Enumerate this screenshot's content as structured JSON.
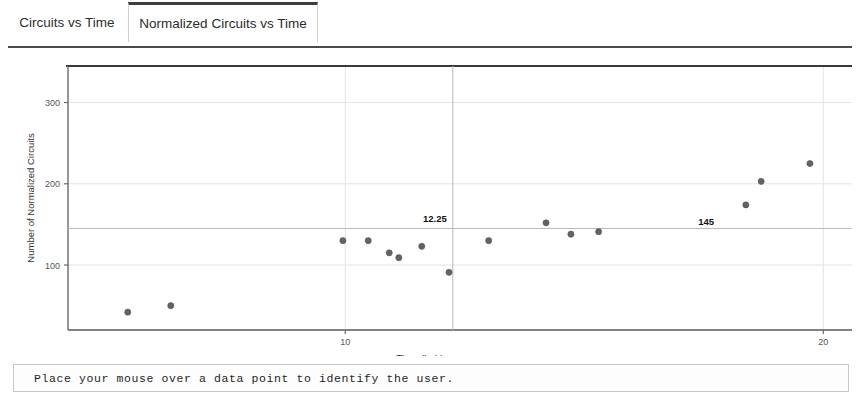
{
  "tabs": [
    {
      "label": "Circuits vs Time",
      "active": false
    },
    {
      "label": "Normalized Circuits vs Time",
      "active": true
    }
  ],
  "status": {
    "message": "Place your mouse over a data point to identify the user."
  },
  "colors": {
    "point": "#636363",
    "axis": "#4a4a4a",
    "grid": "#e3e3e3",
    "marker_line": "#b8b8b8",
    "text": "#1a1a1a",
    "panel_border": "#9a9a9a",
    "tab_active_top": "#3d3d3d"
  },
  "chart_data": {
    "type": "scatter",
    "title": "",
    "xlabel": "Time (in h)",
    "ylabel": "Number of Normalized Circuits",
    "xlim": [
      4.2,
      20.6
    ],
    "ylim": [
      20,
      345
    ],
    "xticks": [
      10,
      20
    ],
    "xticklabels": [
      "10",
      "20"
    ],
    "yticks": [
      100,
      200,
      300
    ],
    "yticklabels": [
      "100",
      "200",
      "300"
    ],
    "grid": true,
    "legend": false,
    "annotations": [
      {
        "label": "12.25",
        "type": "vline",
        "x": 12.25
      },
      {
        "label": "145",
        "type": "hline",
        "y": 145
      }
    ],
    "series": [
      {
        "name": "Normalized Circuits",
        "marker": "circle",
        "points": [
          {
            "x": 5.45,
            "y": 42
          },
          {
            "x": 6.35,
            "y": 50
          },
          {
            "x": 9.95,
            "y": 130
          },
          {
            "x": 10.48,
            "y": 130
          },
          {
            "x": 10.92,
            "y": 115
          },
          {
            "x": 11.12,
            "y": 109
          },
          {
            "x": 11.6,
            "y": 123
          },
          {
            "x": 12.17,
            "y": 91
          },
          {
            "x": 13.0,
            "y": 130
          },
          {
            "x": 14.2,
            "y": 152
          },
          {
            "x": 14.72,
            "y": 138
          },
          {
            "x": 15.3,
            "y": 141
          },
          {
            "x": 18.38,
            "y": 174
          },
          {
            "x": 18.7,
            "y": 203
          },
          {
            "x": 19.72,
            "y": 225
          },
          {
            "x": 22.2,
            "y": 166
          }
        ]
      }
    ]
  }
}
